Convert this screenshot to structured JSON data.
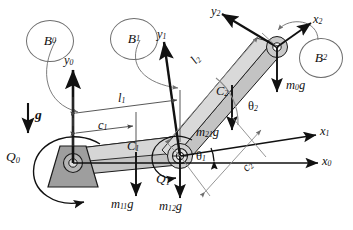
{
  "figure": {
    "type": "mechanism-free-body-diagram",
    "stroke_color": "#1a1a1a",
    "link_fill": "#b9b9b9",
    "link_fill_light": "#d2d2d2",
    "support_fill": "#9a9a9a",
    "leader_color": "#6e6e6e"
  },
  "bodies": [
    {
      "id": "B0",
      "label": "B",
      "sub": "0"
    },
    {
      "id": "B1",
      "label": "B",
      "sub": "1"
    },
    {
      "id": "B2",
      "label": "B",
      "sub": "2"
    }
  ],
  "frames": [
    {
      "id": "y0",
      "label": "y",
      "sub": "0"
    },
    {
      "id": "x0",
      "label": "x",
      "sub": "0"
    },
    {
      "id": "y1",
      "label": "y",
      "sub": "1"
    },
    {
      "id": "x1",
      "label": "x",
      "sub": "1"
    },
    {
      "id": "y2",
      "label": "y",
      "sub": "2"
    },
    {
      "id": "x2",
      "label": "x",
      "sub": "2"
    }
  ],
  "dimensions": [
    {
      "id": "l1",
      "label": "l",
      "sub": "1"
    },
    {
      "id": "l2",
      "label": "l",
      "sub": "2"
    },
    {
      "id": "c1",
      "label": "c",
      "sub": "1"
    },
    {
      "id": "c2",
      "label": "c",
      "sub": "2"
    }
  ],
  "mass_centers": [
    {
      "id": "C1",
      "label": "C",
      "sub": "1"
    },
    {
      "id": "C2",
      "label": "C",
      "sub": "2"
    }
  ],
  "forces": [
    {
      "id": "g",
      "label": "g",
      "sub": "",
      "bold": true,
      "note": "gravity direction"
    },
    {
      "id": "m11g",
      "label": "m",
      "sub": "11",
      "suffix": "g"
    },
    {
      "id": "m12g",
      "label": "m",
      "sub": "12",
      "suffix": "g"
    },
    {
      "id": "m21g",
      "label": "m",
      "sub": "21",
      "suffix": "g"
    },
    {
      "id": "m0g",
      "label": "m",
      "sub": "0",
      "suffix": "g"
    }
  ],
  "torques": [
    {
      "id": "Q0",
      "label": "Q",
      "sub": "0"
    },
    {
      "id": "Q1",
      "label": "Q",
      "sub": "1"
    }
  ],
  "angles": [
    {
      "id": "theta1",
      "label": "θ",
      "sub": "1"
    },
    {
      "id": "theta2",
      "label": "θ",
      "sub": "2"
    }
  ]
}
